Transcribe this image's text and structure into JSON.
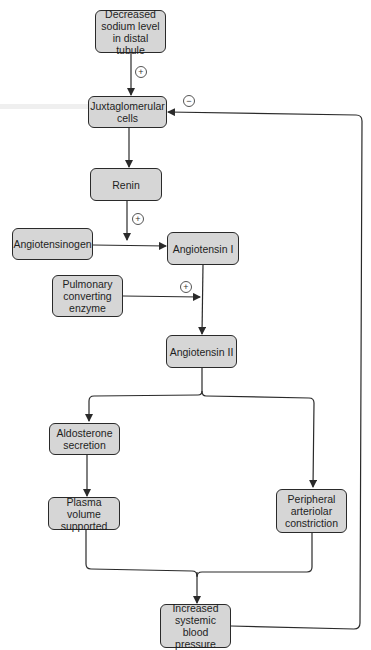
{
  "diagram": {
    "colors": {
      "box_fill": "#d6d6d6",
      "box_border": "#2a2a2a",
      "line": "#2a2a2a"
    },
    "nodes": {
      "decreased_sodium": "Decreased\nsodium level\nin distal tubule",
      "juxtaglomerular": "Juxtaglomerular\ncells",
      "renin": "Renin",
      "angiotensinogen": "Angiotensinogen",
      "angiotensin_1": "Angiotensin I",
      "pulmonary": "Pulmonary\nconverting\nenzyme",
      "angiotensin_2": "Angiotensin II",
      "aldosterone": "Aldosterone\nsecretion",
      "plasma_volume": "Plasma volume\nsupported",
      "peripheral": "Peripheral\narteriolar\nconstriction",
      "increased_bp": "Increased\nsystemic blood\npressure"
    },
    "signs": {
      "sodium_to_jg": "+",
      "feedback": "−",
      "renin_to_angiotensinogen": "+",
      "pulmonary_to_angiotensin": "+"
    },
    "edges": [
      {
        "from": "decreased_sodium",
        "to": "juxtaglomerular",
        "sign": "+"
      },
      {
        "from": "juxtaglomerular",
        "to": "renin"
      },
      {
        "from": "renin",
        "to": "angiotensinogen-conversion",
        "sign": "+"
      },
      {
        "from": "angiotensinogen",
        "to": "angiotensin_1"
      },
      {
        "from": "angiotensin_1",
        "to": "angiotensin_2"
      },
      {
        "from": "pulmonary",
        "to": "angiotensin_1-conversion",
        "sign": "+"
      },
      {
        "from": "angiotensin_2",
        "to": "aldosterone"
      },
      {
        "from": "angiotensin_2",
        "to": "peripheral"
      },
      {
        "from": "aldosterone",
        "to": "plasma_volume"
      },
      {
        "from": "plasma_volume",
        "to": "increased_bp"
      },
      {
        "from": "peripheral",
        "to": "increased_bp"
      },
      {
        "from": "increased_bp",
        "to": "juxtaglomerular",
        "sign": "−"
      }
    ]
  }
}
